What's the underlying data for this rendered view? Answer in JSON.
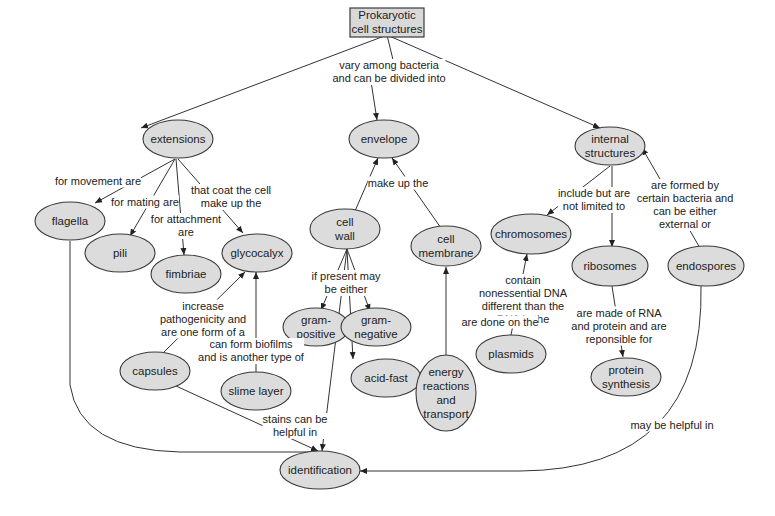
{
  "title": "Prokaryotic cell structures",
  "colors": {
    "node_fill": "#dcdcdc",
    "node_stroke": "#3a3a3a",
    "edge": "#333333",
    "background": "#ffffff"
  },
  "nodes": {
    "root": {
      "label": "Prokaryotic\ncell structures",
      "x": 387,
      "y": 22
    },
    "extensions": {
      "label": "extensions",
      "x": 178,
      "y": 139
    },
    "envelope": {
      "label": "envelope",
      "x": 384,
      "y": 139
    },
    "internal": {
      "label": "internal\nstructures",
      "x": 610,
      "y": 146
    },
    "flagella": {
      "label": "flagella",
      "x": 70,
      "y": 221
    },
    "pili": {
      "label": "pili",
      "x": 120,
      "y": 253
    },
    "fimbriae": {
      "label": "fimbriae",
      "x": 186,
      "y": 274
    },
    "glycocalyx": {
      "label": "glycocalyx",
      "x": 257,
      "y": 253
    },
    "cell_wall": {
      "label": "cell\nwall",
      "x": 345,
      "y": 229
    },
    "cell_membrane": {
      "label": "cell\nmembrane",
      "x": 446,
      "y": 246
    },
    "chromosomes": {
      "label": "chromosomes",
      "x": 531,
      "y": 234
    },
    "ribosomes": {
      "label": "ribosomes",
      "x": 610,
      "y": 266
    },
    "endospores": {
      "label": "endospores",
      "x": 706,
      "y": 266
    },
    "gram_positive": {
      "label": "gram-\npositive",
      "x": 316,
      "y": 327
    },
    "gram_negative": {
      "label": "gram-\nnegative",
      "x": 376,
      "y": 327
    },
    "acid_fast": {
      "label": "acid-fast",
      "x": 386,
      "y": 378
    },
    "capsules": {
      "label": "capsules",
      "x": 155,
      "y": 371
    },
    "slime_layer": {
      "label": "slime layer",
      "x": 256,
      "y": 391
    },
    "plasmids": {
      "label": "plasmids",
      "x": 511,
      "y": 354
    },
    "energy": {
      "label": "energy\nreactions\nand\ntransport",
      "x": 446,
      "y": 393
    },
    "protein_synthesis": {
      "label": "protein\nsynthesis",
      "x": 626,
      "y": 377
    },
    "identification": {
      "label": "identification",
      "x": 320,
      "y": 470
    }
  },
  "links": {
    "vary": "vary among bacteria\nand can be divided into",
    "movement": "for movement are",
    "mating": "for mating are",
    "attachment": "for attachment\nare",
    "coat": "that coat the cell\nmake up the",
    "make_up": "make up the",
    "include": "include but are\nnot limited to",
    "formed": "are formed by\ncertain bacteria and\ncan be either\nexternal or",
    "if_present": "if present may\nbe either",
    "contain": "contain\nnonessential DNA\ndifferent than the\nDNA in the",
    "made_of": "are made of RNA\nand protein and are\nreponsible for",
    "pathogenicity": "increase\npathogenicity and\nare one form of a",
    "biofilms": "can form biofilms\nand is another type of",
    "done_on": "are done on the",
    "stains": "stains can be\nhelpful in",
    "may_be": "may be helpful in"
  }
}
